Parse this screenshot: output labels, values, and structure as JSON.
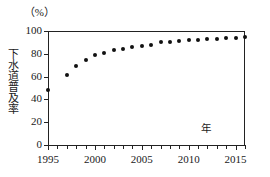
{
  "chart_data": {
    "type": "scatter",
    "title": "",
    "subtitle": "",
    "xlabel": "年",
    "ylabel": "下水道普及率",
    "unit_label": "（%）",
    "xlim": [
      1995,
      2016
    ],
    "ylim": [
      0,
      100
    ],
    "grid": false,
    "legend": null,
    "x_tick_labels": [
      "1995",
      "2000",
      "2005",
      "2010",
      "2015"
    ],
    "x_tick_values": [
      1995,
      2000,
      2005,
      2010,
      2015
    ],
    "x_minor_tick_values": [
      1995,
      1996,
      1997,
      1998,
      1999,
      2000,
      2001,
      2002,
      2003,
      2004,
      2005,
      2006,
      2007,
      2008,
      2009,
      2010,
      2011,
      2012,
      2013,
      2014,
      2015,
      2016
    ],
    "y_tick_labels": [
      "0",
      "20",
      "40",
      "60",
      "80",
      "100"
    ],
    "y_tick_values": [
      0,
      20,
      40,
      60,
      80,
      100
    ],
    "x": [
      1995,
      1997,
      1998,
      1999,
      2000,
      2001,
      2002,
      2003,
      2004,
      2005,
      2006,
      2007,
      2008,
      2009,
      2010,
      2011,
      2012,
      2013,
      2014,
      2015,
      2016
    ],
    "values": [
      48,
      61,
      69,
      75,
      79,
      81,
      83,
      84,
      86,
      87,
      88,
      90,
      90,
      91,
      92,
      92,
      93,
      93,
      94,
      94,
      95
    ],
    "marker": "circle",
    "marker_color": "#111111",
    "axis_color": "#222222"
  }
}
